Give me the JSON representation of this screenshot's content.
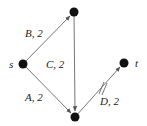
{
  "diagram": {
    "type": "directed-flow-network",
    "colors": {
      "edge": "#555555",
      "node": "#111111",
      "text": "#222222"
    },
    "nodes": [
      {
        "id": "s",
        "label": "s",
        "x": 23,
        "y": 64
      },
      {
        "id": "top",
        "label": "",
        "x": 74,
        "y": 12
      },
      {
        "id": "bottom",
        "label": "",
        "x": 75,
        "y": 117
      },
      {
        "id": "t",
        "label": "t",
        "x": 124,
        "y": 63
      }
    ],
    "edges": [
      {
        "id": "B",
        "from": "s",
        "to": "top",
        "label": "B, 2"
      },
      {
        "id": "C",
        "from": "top",
        "to": "bottom",
        "label": "C, 2"
      },
      {
        "id": "A",
        "from": "s",
        "to": "bottom",
        "label": "A, 2"
      },
      {
        "id": "D",
        "from": "bottom",
        "to": "t",
        "label": "D, 2",
        "marked": true,
        "mark": "double-slash"
      }
    ]
  }
}
